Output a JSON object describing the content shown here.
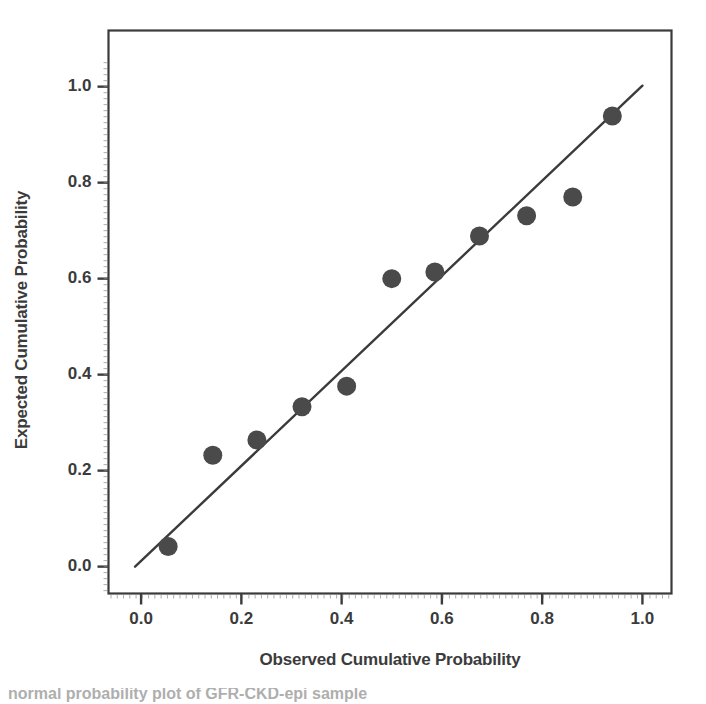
{
  "figure": {
    "background_color": "#ffffff",
    "ink_color": "#3b3b3b",
    "marker_color": "#4a4a4a",
    "caption_partial": "normal probability plot of GFR-CKD-epi sample"
  },
  "chart_data": {
    "type": "scatter",
    "title": "",
    "subtitle": "",
    "xlabel": "Observed Cumulative Probability",
    "ylabel": "Expected Cumulative Probability",
    "xlim": [
      -0.065,
      1.058
    ],
    "ylim": [
      -0.056,
      1.117
    ],
    "grid": false,
    "legend": null,
    "xticks": [
      0.0,
      0.2,
      0.4,
      0.6,
      0.8,
      1.0
    ],
    "xticklabels": [
      "0.0",
      "0.2",
      "0.4",
      "0.6",
      "0.8",
      "1.0"
    ],
    "yticks": [
      0.0,
      0.2,
      0.4,
      0.6,
      0.8,
      1.0
    ],
    "yticklabels": [
      "0.0",
      "0.2",
      "0.4",
      "0.6",
      "0.8",
      "1.0"
    ],
    "minor_ticks": true,
    "reference_line": {
      "label": "diagonal reference line",
      "x": [
        -0.012,
        1.0
      ],
      "y": [
        0.0,
        1.002
      ],
      "color": "#3b3b3b"
    },
    "series": [
      {
        "name": "P-P points",
        "marker": "circle",
        "color": "#4a4a4a",
        "x": [
          0.054,
          0.143,
          0.231,
          0.321,
          0.41,
          0.5,
          0.586,
          0.675,
          0.769,
          0.861,
          0.94
        ],
        "y": [
          0.042,
          0.232,
          0.264,
          0.333,
          0.376,
          0.6,
          0.614,
          0.689,
          0.731,
          0.77,
          0.939
        ]
      }
    ]
  },
  "axis_titles": {
    "x": "Observed Cumulative Probability",
    "y": "Expected Cumulative Probability"
  }
}
